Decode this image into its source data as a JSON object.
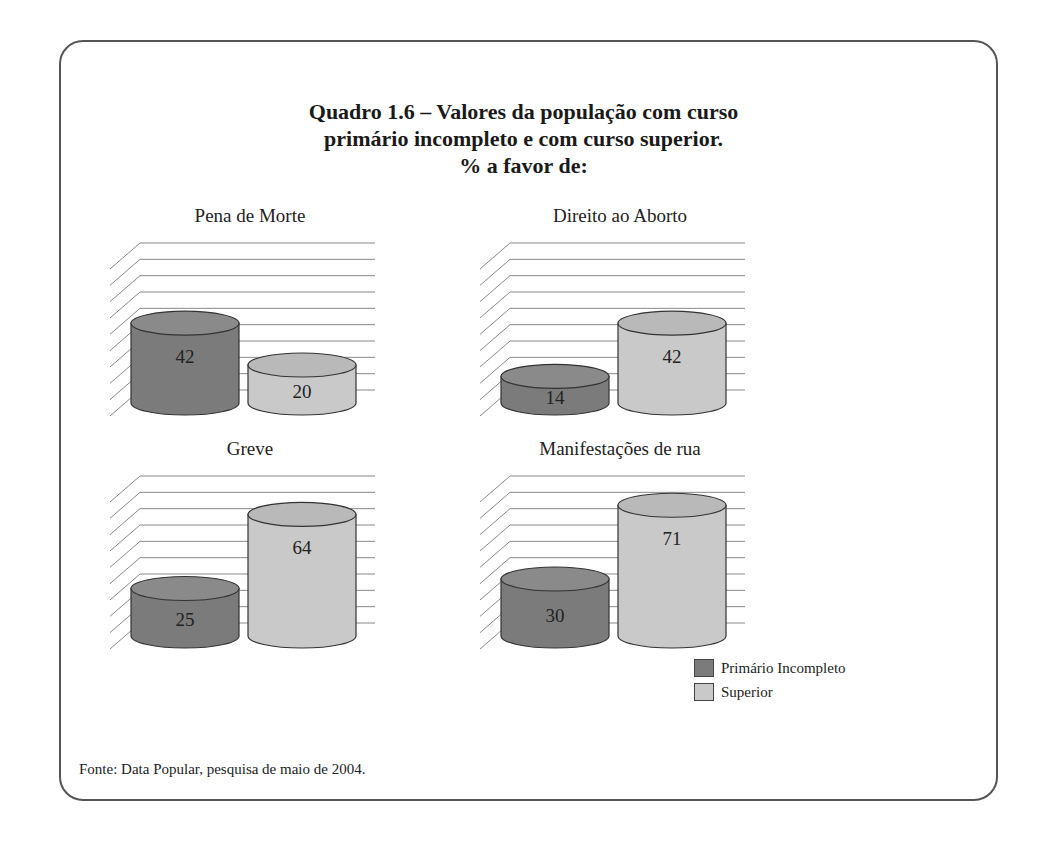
{
  "title": {
    "line1": "Quadro 1.6 – Valores da população com curso",
    "line2": "primário incompleto e com curso superior.",
    "line3": "% a favor de:"
  },
  "legend": {
    "items": [
      {
        "label": "Primário Incompleto",
        "color": "#7b7b7b"
      },
      {
        "label": "Superior",
        "color": "#c9c9c9"
      }
    ]
  },
  "source": "Fonte: Data Popular, pesquisa de maio de 2004.",
  "chart_data": [
    {
      "type": "bar",
      "title": "Pena de Morte",
      "categories": [
        "Primário Incompleto",
        "Superior"
      ],
      "values": [
        42,
        20
      ],
      "ylabel": "% a favor",
      "grid": true,
      "style": "3d-cylinder"
    },
    {
      "type": "bar",
      "title": "Direito ao Aborto",
      "categories": [
        "Primário Incompleto",
        "Superior"
      ],
      "values": [
        14,
        42
      ],
      "ylabel": "% a favor",
      "grid": true,
      "style": "3d-cylinder"
    },
    {
      "type": "bar",
      "title": "Greve",
      "categories": [
        "Primário Incompleto",
        "Superior"
      ],
      "values": [
        25,
        64
      ],
      "ylabel": "% a favor",
      "grid": true,
      "style": "3d-cylinder"
    },
    {
      "type": "bar",
      "title": "Manifestações de rua",
      "categories": [
        "Primário Incompleto",
        "Superior"
      ],
      "values": [
        30,
        71
      ],
      "ylabel": "% a favor",
      "grid": true,
      "style": "3d-cylinder"
    }
  ],
  "colors": {
    "primario": "#7b7b7b",
    "primario_top": "#8a8a8a",
    "superior": "#c9c9c9",
    "superior_top": "#b9b9b9",
    "grid": "#888888",
    "frame": "#555555"
  }
}
